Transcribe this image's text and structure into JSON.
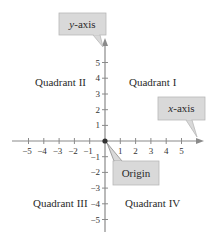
{
  "diagram": {
    "type": "cartesian-coordinate-plane",
    "x_ticks": [
      "−5",
      "−4",
      "−3",
      "−2",
      "−1",
      "1",
      "2",
      "3",
      "4",
      "5"
    ],
    "y_ticks_pos": [
      "5",
      "4",
      "3",
      "2",
      "1"
    ],
    "y_ticks_neg": [
      "−1",
      "−2",
      "−3",
      "−4",
      "−5"
    ],
    "quadrants": {
      "q1": "Quadrant I",
      "q2": "Quadrant II",
      "q3": "Quadrant III",
      "q4": "Quadrant IV"
    },
    "callouts": {
      "y_axis": {
        "var": "y",
        "suffix": "-axis"
      },
      "x_axis": {
        "var": "x",
        "suffix": "-axis"
      },
      "origin": "Origin"
    },
    "colors": {
      "axis": "#8a8a8a",
      "callout_fill": "#d9d9d9",
      "callout_border": "#a8a8a8",
      "text": "#2a2a2a",
      "origin_point": "#333333"
    }
  }
}
